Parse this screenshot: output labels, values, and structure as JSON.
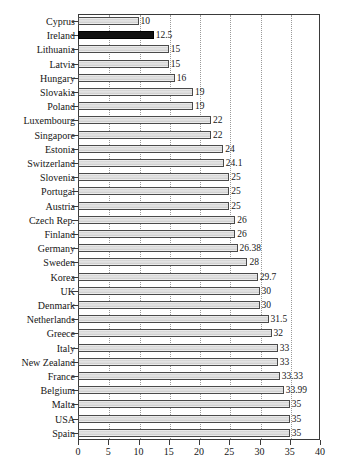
{
  "chart_data": {
    "type": "bar",
    "orientation": "horizontal",
    "title": "",
    "subtitle": "",
    "xlabel": "",
    "ylabel": "",
    "xlim": [
      0,
      40
    ],
    "xticks": [
      0,
      5,
      10,
      15,
      20,
      25,
      30,
      35,
      40
    ],
    "xtick_labels": [
      "0",
      "5",
      "10",
      "15",
      "20",
      "25",
      "30",
      "35",
      "40"
    ],
    "grid": true,
    "grid_axis": "x",
    "grid_style": "dotted",
    "legend": null,
    "highlight_category": "Ireland",
    "highlight_color": "#111111",
    "bar_fill_color": "#e0e0e0",
    "bar_border_color": "#4a4a4a",
    "frame_color": "#3a3a3a",
    "categories": [
      "Cyprus",
      "Ireland",
      "Lithuania",
      "Latvia",
      "Hungary",
      "Slovakia",
      "Poland",
      "Luxembourg",
      "Singapore",
      "Estonia",
      "Switzerland",
      "Slovenia",
      "Portugal",
      "Austria",
      "Czech Rep.",
      "Finland",
      "Germany",
      "Sweden",
      "Korea",
      "UK",
      "Denmark",
      "Netherlands",
      "Greece",
      "Italy",
      "New Zealand",
      "France",
      "Belgium",
      "Malta",
      "USA",
      "Spain"
    ],
    "values": [
      10,
      12.5,
      15,
      15,
      16,
      19,
      19,
      22,
      22,
      24,
      24.1,
      25,
      25,
      25,
      26,
      26,
      26.38,
      28,
      29.7,
      30,
      30,
      31.5,
      32,
      33,
      33,
      33.33,
      33.99,
      35,
      35,
      35
    ],
    "value_labels": [
      "10",
      "12.5",
      "15",
      "15",
      "16",
      "19",
      "19",
      "22",
      "22",
      "24",
      "24.1",
      "25",
      "25",
      "25",
      "26",
      "26",
      "26.38",
      "28",
      "29.7",
      "30",
      "30",
      "31.5",
      "32",
      "33",
      "33",
      "33.33",
      "33.99",
      "35",
      "35",
      "35"
    ]
  }
}
